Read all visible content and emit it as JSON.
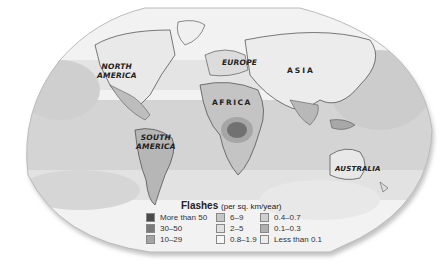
{
  "map": {
    "title": "Flashes",
    "units": "(per sq. km/year)",
    "continent_labels": [
      {
        "name": "NORTH",
        "name2": "AMERICA"
      },
      {
        "name": "EUROPE"
      },
      {
        "name": "ASIA"
      },
      {
        "name": "AFRICA"
      },
      {
        "name": "SOUTH",
        "name2": "AMERICA"
      },
      {
        "name": "AUSTRALIA"
      }
    ],
    "legend": [
      {
        "label": "More than 50",
        "color": "#4a4a4a"
      },
      {
        "label": "30–50",
        "color": "#7a7a7a"
      },
      {
        "label": "10–29",
        "color": "#a4a4a4"
      },
      {
        "label": "6–9",
        "color": "#c6c6c6"
      },
      {
        "label": "2–5",
        "color": "#e0e0e0"
      },
      {
        "label": "0.8–1.9",
        "color": "#f6f6f6"
      },
      {
        "label": "0.4–0.7",
        "color": "#cfcfcf"
      },
      {
        "label": "0.1–0.3",
        "color": "#b0b0b0"
      },
      {
        "label": "Less than 0.1",
        "color": "#ececec"
      }
    ]
  }
}
